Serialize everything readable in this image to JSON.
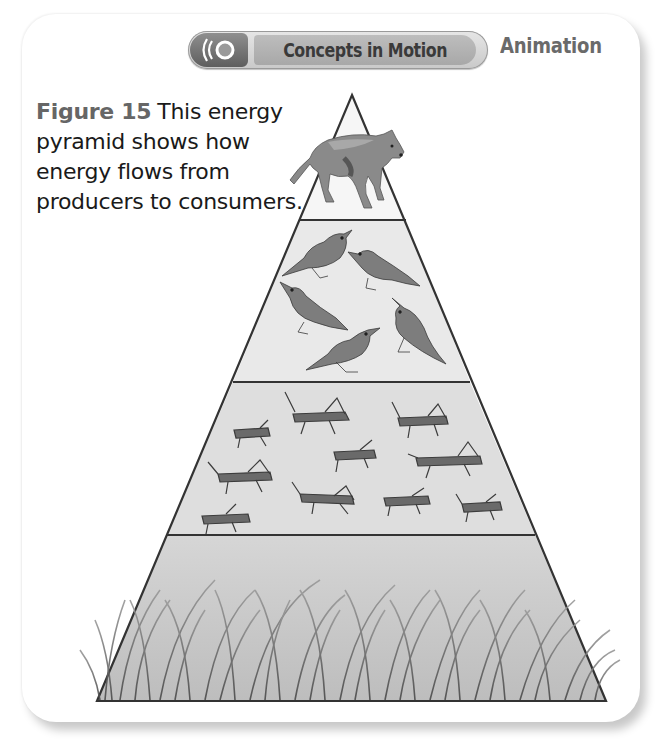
{
  "header": {
    "button_label": "Concepts in Motion",
    "button_icon": "sound-waves-icon",
    "media_type": "Animation"
  },
  "caption": {
    "figure_number": "Figure 15",
    "text": "This energy pyramid shows how energy flows from producers to consumers."
  },
  "pyramid": {
    "levels": [
      {
        "name": "Tertiary consumer",
        "organism": "wolf",
        "count": 1
      },
      {
        "name": "Secondary consumers",
        "organism": "bird",
        "count": 5
      },
      {
        "name": "Primary consumers",
        "organism": "grasshopper",
        "count": 10
      },
      {
        "name": "Producers",
        "organism": "grass",
        "count": 1
      }
    ],
    "colors": {
      "outline": "#333333",
      "tier1_fill": "#f4f4f4",
      "tier2_fill": "#e8e8e8",
      "tier3_fill": "#dcdcdc",
      "tier4_fill": "#c8c8c8"
    }
  }
}
